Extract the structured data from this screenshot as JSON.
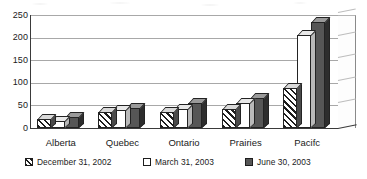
{
  "chart_data": {
    "type": "bar",
    "title": "",
    "xlabel": "",
    "ylabel": "",
    "ylim": [
      0,
      250
    ],
    "yticks": [
      0,
      50,
      100,
      150,
      200,
      250
    ],
    "grid": true,
    "legend_position": "bottom",
    "style": "3d-clustered-column",
    "categories": [
      "Alberta",
      "Quebec",
      "Ontario",
      "Prairies",
      "Pacifc"
    ],
    "series": [
      {
        "name": "December 31, 2002",
        "fill": "diagonal-hatch",
        "color": "#ffffff",
        "values": [
          20,
          35,
          35,
          42,
          88
        ]
      },
      {
        "name": "March 31, 2003",
        "fill": "solid-white",
        "color": "#ffffff",
        "values": [
          15,
          40,
          42,
          55,
          205
        ]
      },
      {
        "name": "June 30, 2003",
        "fill": "solid-gray",
        "color": "#565656",
        "values": [
          25,
          45,
          55,
          67,
          235
        ]
      }
    ]
  },
  "axis": {
    "y_tick_labels": [
      "250",
      "200",
      "150",
      "100",
      "50",
      "0"
    ]
  },
  "legend": {
    "items": [
      {
        "label": "December 31, 2002",
        "swatch": "hatch"
      },
      {
        "label": "March 31, 2003",
        "swatch": "white"
      },
      {
        "label": "June 30, 2003",
        "swatch": "gray"
      }
    ]
  },
  "colors": {
    "series_gray": "#565656",
    "axis": "#3a3a3a",
    "gridline": "#a8a8a8",
    "text": "#1a1a1a"
  }
}
